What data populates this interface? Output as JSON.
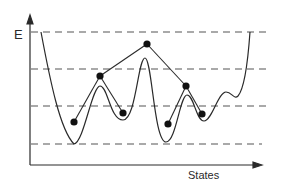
{
  "diagram": {
    "type": "energy-landscape",
    "y_axis_label": "E",
    "x_axis_label": "States",
    "colors": {
      "background": "#ffffff",
      "stroke": "#2a2a2a",
      "dash": "#555555",
      "dot": "#111111"
    },
    "dashed_levels": [
      32,
      69,
      106,
      144
    ],
    "minima_dots": [
      {
        "x": 74,
        "y": 122
      },
      {
        "x": 123,
        "y": 113
      },
      {
        "x": 168,
        "y": 124
      },
      {
        "x": 202,
        "y": 114
      }
    ],
    "saddle_dots": [
      {
        "x": 100,
        "y": 76
      },
      {
        "x": 186,
        "y": 86
      }
    ],
    "top_dot": {
      "x": 147,
      "y": 44
    },
    "tree_edges": [
      [
        [
          74,
          122
        ],
        [
          100,
          76
        ]
      ],
      [
        [
          100,
          76
        ],
        [
          123,
          113
        ]
      ],
      [
        [
          100,
          76
        ],
        [
          147,
          44
        ]
      ],
      [
        [
          147,
          44
        ],
        [
          186,
          86
        ]
      ],
      [
        [
          186,
          86
        ],
        [
          168,
          124
        ]
      ],
      [
        [
          186,
          86
        ],
        [
          202,
          114
        ]
      ]
    ]
  }
}
